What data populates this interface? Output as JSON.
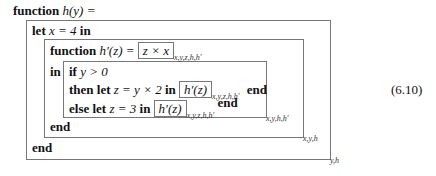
{
  "equation_number": "(6.10)",
  "lines": {
    "header": {
      "kw": "function",
      "math": "h(y) ="
    },
    "let_x": {
      "kw1": "let",
      "math": "x = 4",
      "kw2": "in"
    },
    "func_hp": {
      "kw": "function",
      "math": "h′(z) =",
      "boxed": "z × x",
      "env": "x,y,z,h,h′"
    },
    "in_if": {
      "kw_in": "in",
      "kw_if": "if",
      "math": "y > 0"
    },
    "then": {
      "kw": "then let",
      "math": "z = y × 2",
      "kw_in": "in",
      "boxed": "h′(z)",
      "env": "x,y,z,h,h′",
      "kw_end": "end"
    },
    "else": {
      "kw": "else let",
      "math": "z = 3",
      "kw_in": "in",
      "boxed": "h′(z)",
      "env": "x,y,z,h,h′",
      "kw_end": "end"
    },
    "end_inner": {
      "kw": "end"
    },
    "end_outer": {
      "kw": "end"
    }
  },
  "box_envs": {
    "inner": "x,y,h,h′",
    "middle": "x,y,h",
    "outer": "y,h"
  }
}
